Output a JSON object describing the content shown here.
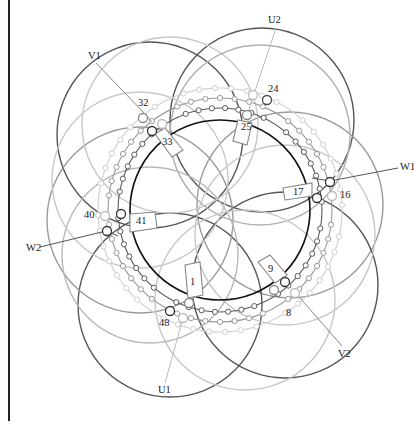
{
  "diagram": {
    "type": "three-phase stator winding diagram",
    "center": [
      220,
      210
    ],
    "stator_radius": 90,
    "colors": {
      "dark": "#555555",
      "medium": "#8f8f8f",
      "light": "#c4c4c4",
      "stator": "#111111",
      "text": "#222222"
    },
    "terminals": [
      {
        "id": "U1",
        "label": "U1",
        "x": 163,
        "y": 393
      },
      {
        "id": "U2",
        "label": "U2",
        "x": 276,
        "y": 23
      },
      {
        "id": "V1",
        "label": "V1",
        "x": 96,
        "y": 59
      },
      {
        "id": "V2",
        "label": "V2",
        "x": 346,
        "y": 353
      },
      {
        "id": "W1",
        "label": "W1",
        "x": 404,
        "y": 168
      },
      {
        "id": "W2",
        "label": "W2",
        "x": 35,
        "y": 248
      }
    ],
    "slot_numbers": [
      {
        "label": "1",
        "x": 193,
        "y": 284
      },
      {
        "label": "8",
        "x": 289,
        "y": 315
      },
      {
        "label": "9",
        "x": 271,
        "y": 270
      },
      {
        "label": "16",
        "x": 346,
        "y": 196
      },
      {
        "label": "17",
        "x": 297,
        "y": 194
      },
      {
        "label": "24",
        "x": 274,
        "y": 92
      },
      {
        "label": "25",
        "x": 247,
        "y": 130
      },
      {
        "label": "32",
        "x": 143,
        "y": 104
      },
      {
        "label": "33",
        "x": 167,
        "y": 144
      },
      {
        "label": "40",
        "x": 89,
        "y": 218
      },
      {
        "label": "41",
        "x": 142,
        "y": 222
      },
      {
        "label": "48",
        "x": 165,
        "y": 324
      }
    ]
  }
}
